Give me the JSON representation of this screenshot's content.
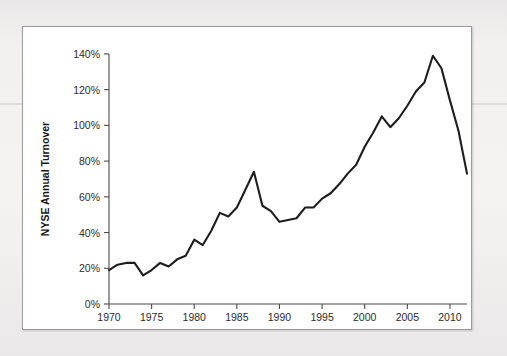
{
  "figure": {
    "background_color": "#ffffff",
    "page_background_color": "#eceaea",
    "border_color": "#9c9a9a",
    "line_color": "#1d1d1d"
  },
  "chart_data": {
    "type": "line",
    "title": "",
    "xlabel": "Year",
    "ylabel": "NYSE Annual Turnover",
    "xlim": [
      1970,
      2012
    ],
    "ylim": [
      0,
      145
    ],
    "grid": false,
    "legend": null,
    "y_tick_labels": [
      "0%",
      "20%",
      "40%",
      "60%",
      "80%",
      "100%",
      "120%",
      "140%"
    ],
    "y_tick_values": [
      0,
      20,
      40,
      60,
      80,
      100,
      120,
      140
    ],
    "x_tick_labels": [
      "1970",
      "1975",
      "1980",
      "1985",
      "1990",
      "1995",
      "2000",
      "2005",
      "2010"
    ],
    "x_tick_values": [
      1970,
      1975,
      1980,
      1985,
      1990,
      1995,
      2000,
      2005,
      2010
    ],
    "y_unit": "%",
    "series": [
      {
        "name": "NYSE Annual Turnover",
        "x": [
          1970,
          1971,
          1972,
          1973,
          1974,
          1975,
          1976,
          1977,
          1978,
          1979,
          1980,
          1981,
          1982,
          1983,
          1984,
          1985,
          1986,
          1987,
          1988,
          1989,
          1990,
          1991,
          1992,
          1993,
          1994,
          1995,
          1996,
          1997,
          1998,
          1999,
          2000,
          2001,
          2002,
          2003,
          2004,
          2005,
          2006,
          2007,
          2008,
          2009,
          2010,
          2011,
          2012
        ],
        "values": [
          19,
          22,
          23,
          23,
          16,
          19,
          23,
          21,
          25,
          27,
          36,
          33,
          41,
          51,
          49,
          54,
          64,
          74,
          55,
          52,
          46,
          47,
          48,
          54,
          54,
          59,
          62,
          67,
          73,
          78,
          88,
          96,
          105,
          99,
          104,
          111,
          119,
          124,
          139,
          132,
          114,
          97,
          73
        ]
      }
    ]
  }
}
